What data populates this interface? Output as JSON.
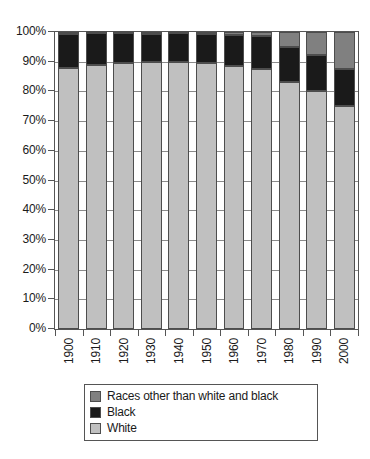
{
  "chart_data": {
    "type": "bar",
    "subtype": "stacked-percent-100",
    "title": "",
    "subtitle": "",
    "xlabel": "",
    "ylabel": "",
    "ylim": [
      0,
      100
    ],
    "y_tick_labels": [
      "100%",
      "90%",
      "80%",
      "70%",
      "60%",
      "50%",
      "40%",
      "30%",
      "20%",
      "10%",
      "0%"
    ],
    "y_tick_values": [
      100,
      90,
      80,
      70,
      60,
      50,
      40,
      30,
      20,
      10,
      0
    ],
    "grid": true,
    "legend_position": "bottom",
    "categories": [
      "1900",
      "1910",
      "1920",
      "1930",
      "1940",
      "1950",
      "1960",
      "1970",
      "1980",
      "1990",
      "2000"
    ],
    "series": [
      {
        "name": "White",
        "color": "#c0c0c0",
        "values": [
          87.9,
          88.9,
          89.7,
          89.8,
          89.8,
          89.5,
          88.6,
          87.5,
          83.1,
          80.3,
          75.1
        ]
      },
      {
        "name": "Black",
        "color": "#1a1a1a",
        "values": [
          11.6,
          10.7,
          9.9,
          9.7,
          9.8,
          10.0,
          10.5,
          11.1,
          11.7,
          12.1,
          12.3
        ]
      },
      {
        "name": "Races other than white and black",
        "color": "#808080",
        "values": [
          0.5,
          0.4,
          0.4,
          0.5,
          0.4,
          0.5,
          0.9,
          1.4,
          5.2,
          7.6,
          12.6
        ]
      }
    ],
    "stack_order_bottom_to_top": [
      "White",
      "Black",
      "Races other than white and black"
    ],
    "legend_entries": [
      {
        "label": "Races other than white and black",
        "color": "#808080"
      },
      {
        "label": "Black",
        "color": "#1a1a1a"
      },
      {
        "label": "White",
        "color": "#c0c0c0"
      }
    ]
  }
}
